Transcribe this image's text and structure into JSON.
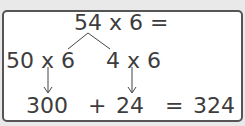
{
  "diagram": {
    "top": "54 x 6 =",
    "left_branch": "50 x 6",
    "right_branch": "4 x 6",
    "result_left": "300",
    "plus": "+",
    "result_right": "24",
    "equals": "=",
    "total": "324"
  },
  "colors": {
    "text": "#3d3d3d",
    "border": "#555555",
    "background": "#e9e9e9",
    "panel": "#ffffff"
  }
}
